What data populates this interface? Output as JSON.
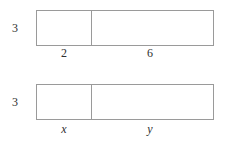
{
  "diagram": {
    "stroke_color": "#9a9a9a",
    "text_color": "#2f2f2f",
    "background": "#ffffff",
    "figures": [
      {
        "id": "numeric-rectangle",
        "height_label": "3",
        "left_segment_label": "2",
        "right_segment_label": "6"
      },
      {
        "id": "variable-rectangle",
        "height_label": "3",
        "left_segment_label": "x",
        "right_segment_label": "y"
      }
    ]
  }
}
